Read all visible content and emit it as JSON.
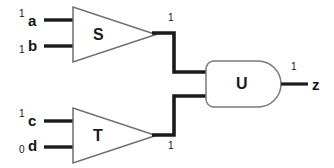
{
  "diagram": {
    "colors": {
      "wire_signal": "#1b1b1b",
      "gate_outline": "#6e6e6e",
      "background": "#ffffff",
      "text": "#151515"
    },
    "gates": [
      {
        "id": "S",
        "label": "S",
        "shape": "triangle",
        "x": 118,
        "y": 35
      },
      {
        "id": "T",
        "label": "T",
        "shape": "triangle",
        "x": 118,
        "y": 136
      },
      {
        "id": "U",
        "label": "U",
        "shape": "and-d-shape",
        "x": 243,
        "y": 84
      }
    ],
    "inputs": [
      {
        "name": "a",
        "value": "1",
        "value_position": "superscript",
        "label_x": 28,
        "label_y": 13,
        "bit_x": 19,
        "bit_y": 9
      },
      {
        "name": "b",
        "value": "1",
        "value_position": "subscript",
        "label_x": 28,
        "label_y": 38,
        "bit_x": 19,
        "bit_y": 45
      },
      {
        "name": "c",
        "value": "1",
        "value_position": "superscript",
        "label_x": 28,
        "label_y": 113,
        "bit_x": 19,
        "bit_y": 109
      },
      {
        "name": "d",
        "value": "0",
        "value_position": "subscript",
        "label_x": 28,
        "label_y": 138,
        "bit_x": 19,
        "bit_y": 145
      }
    ],
    "outputs": [
      {
        "name": "z",
        "value": "1",
        "label_x": 312,
        "label_y": 78,
        "bit_x": 291,
        "bit_y": 62
      }
    ],
    "wire_values": [
      {
        "id": "s-out",
        "value": "1",
        "x": 168,
        "y": 13,
        "anchor": "above"
      },
      {
        "id": "t-out",
        "value": "1",
        "x": 168,
        "y": 141,
        "anchor": "below"
      }
    ]
  }
}
